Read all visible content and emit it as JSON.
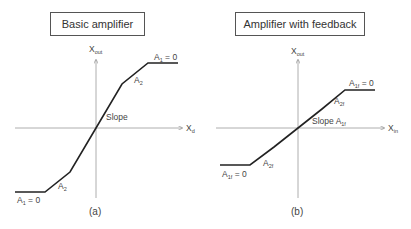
{
  "panels": [
    {
      "id": "a",
      "title": "Basic amplifier",
      "caption": "(a)",
      "y_axis_label": {
        "main": "X",
        "sub": "out"
      },
      "x_axis_label": {
        "main": "X",
        "sub": "d"
      },
      "labels": {
        "upper_saturation": {
          "main": "A",
          "sub": "1",
          "rest": " = 0"
        },
        "upper_segment": {
          "main": "A",
          "sub": "2"
        },
        "center_slope": {
          "main": "Slope",
          "sub": ""
        },
        "lower_segment": {
          "main": "A",
          "sub": "2"
        },
        "lower_saturation": {
          "main": "A",
          "sub": "1",
          "rest": " = 0"
        }
      },
      "curve_points": [
        [
          15,
          192
        ],
        [
          45,
          192
        ],
        [
          70,
          172
        ],
        [
          96,
          128
        ],
        [
          122,
          84
        ],
        [
          148,
          63
        ],
        [
          178,
          63
        ]
      ]
    },
    {
      "id": "b",
      "title": "Amplifier with feedback",
      "caption": "(b)",
      "y_axis_label": {
        "main": "X",
        "sub": "out"
      },
      "x_axis_label": {
        "main": "X",
        "sub": "in"
      },
      "labels": {
        "upper_saturation": {
          "main": "A",
          "sub": "1f",
          "rest": " = 0"
        },
        "upper_segment": {
          "main": "A",
          "sub": "2f"
        },
        "center_slope": {
          "main": "Slope A",
          "sub": "1f"
        },
        "lower_segment": {
          "main": "A",
          "sub": "2f"
        },
        "lower_saturation": {
          "main": "A",
          "sub": "1f",
          "rest": " = 0"
        }
      },
      "curve_points": [
        [
          220,
          165
        ],
        [
          250,
          165
        ],
        [
          274,
          147
        ],
        [
          298,
          128
        ],
        [
          322,
          109
        ],
        [
          345,
          90
        ],
        [
          375,
          90
        ]
      ]
    }
  ],
  "colors": {
    "curve": "#222222",
    "axis": "#888888",
    "text": "#444444",
    "box_border": "#555555"
  }
}
